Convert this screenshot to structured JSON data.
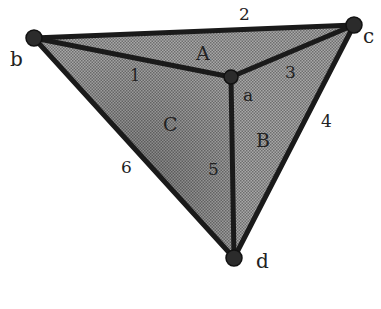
{
  "diagram": {
    "title": "",
    "vertices": [
      {
        "id": "a",
        "label": "a",
        "x": 231,
        "y": 77
      },
      {
        "id": "b",
        "label": "b",
        "x": 34,
        "y": 38
      },
      {
        "id": "c",
        "label": "c",
        "x": 354,
        "y": 25
      },
      {
        "id": "d",
        "label": "d",
        "x": 234,
        "y": 258
      }
    ],
    "edges": [
      {
        "id": "1",
        "label": "1",
        "from": "b",
        "to": "a"
      },
      {
        "id": "2",
        "label": "2",
        "from": "b",
        "to": "c"
      },
      {
        "id": "3",
        "label": "3",
        "from": "a",
        "to": "c"
      },
      {
        "id": "4",
        "label": "4",
        "from": "c",
        "to": "d"
      },
      {
        "id": "5",
        "label": "5",
        "from": "a",
        "to": "d"
      },
      {
        "id": "6",
        "label": "6",
        "from": "b",
        "to": "d"
      }
    ],
    "faces": [
      {
        "id": "A",
        "label": "A",
        "vertices": [
          "b",
          "c",
          "a"
        ]
      },
      {
        "id": "B",
        "label": "B",
        "vertices": [
          "a",
          "c",
          "d"
        ]
      },
      {
        "id": "C",
        "label": "C",
        "vertices": [
          "b",
          "a",
          "d"
        ]
      }
    ],
    "colors": {
      "fill": "#8c8c8c",
      "edge": "#1a1a1a",
      "vertex": "#333333"
    }
  }
}
